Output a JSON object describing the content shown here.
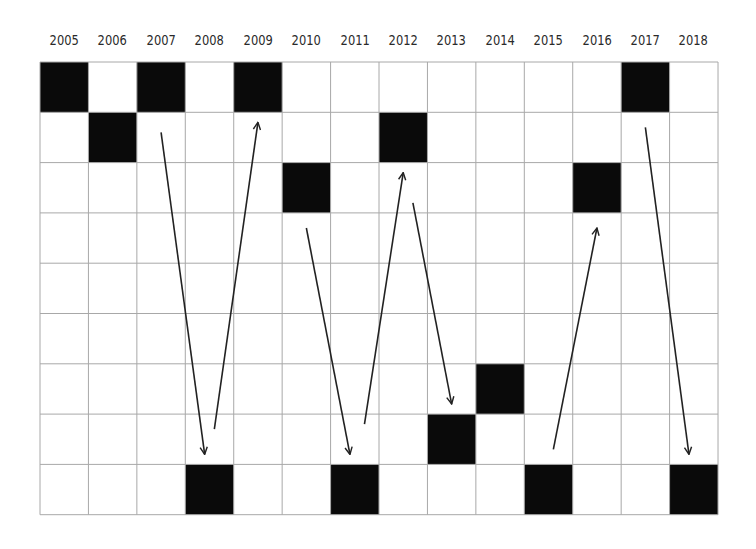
{
  "chart_data": {
    "type": "heatmap",
    "title": "",
    "xlabel": "",
    "ylabel": "",
    "columns": [
      "2005",
      "2006",
      "2007",
      "2008",
      "2009",
      "2010",
      "2011",
      "2012",
      "2013",
      "2014",
      "2015",
      "2016",
      "2017",
      "2018"
    ],
    "rows": 9,
    "grid": true,
    "filled_cells_row_index_by_year": {
      "2005": 0,
      "2006": 1,
      "2007": 0,
      "2008": 8,
      "2009": 0,
      "2010": 2,
      "2011": 8,
      "2012": 1,
      "2013": 7,
      "2014": 6,
      "2015": 8,
      "2016": 2,
      "2017": 0,
      "2018": 8
    },
    "arrows": [
      {
        "from": [
          2007.5,
          1.4
        ],
        "to": [
          2008.4,
          7.8
        ],
        "direction": "down"
      },
      {
        "from": [
          2008.6,
          7.3
        ],
        "to": [
          2009.5,
          1.2
        ],
        "direction": "up"
      },
      {
        "from": [
          2010.5,
          3.3
        ],
        "to": [
          2011.4,
          7.8
        ],
        "direction": "down"
      },
      {
        "from": [
          2011.7,
          7.2
        ],
        "to": [
          2012.5,
          2.2
        ],
        "direction": "up"
      },
      {
        "from": [
          2012.7,
          2.8
        ],
        "to": [
          2013.5,
          6.8
        ],
        "direction": "down"
      },
      {
        "from": [
          2015.6,
          7.7
        ],
        "to": [
          2016.5,
          3.3
        ],
        "direction": "up"
      },
      {
        "from": [
          2017.5,
          1.3
        ],
        "to": [
          2018.4,
          7.8
        ],
        "direction": "down"
      }
    ],
    "colors": {
      "filled": "#0a0a0a",
      "empty": "#ffffff",
      "grid": "#a8a8a8",
      "arrow": "#222222"
    }
  }
}
